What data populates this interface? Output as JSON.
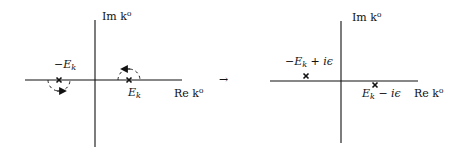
{
  "figure": {
    "left_panel": {
      "axis_labels": {
        "imaginary": "Im k⁰",
        "real": "Re k⁰"
      },
      "poles": [
        {
          "label": "−E_k",
          "label_main": "−E",
          "label_sub": "k",
          "position": "on-axis-left",
          "contour": "dashed semicircle below, arrow right"
        },
        {
          "label": "E_k",
          "label_main": "E",
          "label_sub": "k",
          "position": "on-axis-right",
          "contour": "dashed semicircle above, arrow left"
        }
      ]
    },
    "arrow": {
      "symbol": "→"
    },
    "right_panel": {
      "axis_labels": {
        "imaginary": "Im k⁰",
        "real": "Re k⁰"
      },
      "poles": [
        {
          "label": "−E_k + iε",
          "label_main": "−E",
          "label_sub": "k",
          "label_rest": " + iϵ",
          "position": "above-axis-left"
        },
        {
          "label": "E_k − iε",
          "label_main": "E",
          "label_sub": "k",
          "label_rest": " − iϵ",
          "position": "below-axis-right"
        }
      ]
    },
    "colors": {
      "ink": "#111111",
      "background": "#ffffff"
    }
  }
}
